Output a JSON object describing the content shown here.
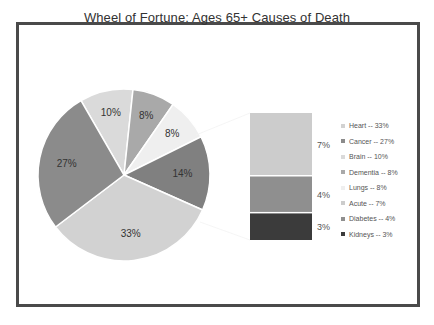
{
  "chart_data": {
    "type": "bar-of-pie",
    "title": "Wheel of Fortune: Ages 65+ Causes of Death",
    "pie": {
      "start_angle_deg": 330,
      "slices": [
        {
          "name": "Brain",
          "value": 10,
          "label": "10%",
          "color": "#dadada"
        },
        {
          "name": "Dementia",
          "value": 8,
          "label": "8%",
          "color": "#a9a9a9"
        },
        {
          "name": "Lungs",
          "value": 8,
          "label": "8%",
          "color": "#efefef"
        },
        {
          "name": "Other",
          "value": 14,
          "label": "14%",
          "color": "#808080"
        },
        {
          "name": "Heart",
          "value": 33,
          "label": "33%",
          "color": "#d2d2d2"
        },
        {
          "name": "Cancer",
          "value": 27,
          "label": "27%",
          "color": "#8b8b8b"
        }
      ]
    },
    "bar": {
      "breakdown_of": "Other",
      "segments": [
        {
          "name": "Acute",
          "value": 7,
          "label": "7%",
          "color": "#cccccc"
        },
        {
          "name": "Diabetes",
          "value": 4,
          "label": "4%",
          "color": "#8f8f8f"
        },
        {
          "name": "Kidneys",
          "value": 3,
          "label": "3%",
          "color": "#3b3b3b"
        }
      ]
    },
    "legend": {
      "position": "right",
      "entries": [
        {
          "label": "Heart -- 33%",
          "color": "#d2d2d2"
        },
        {
          "label": "Cancer -- 27%",
          "color": "#8b8b8b"
        },
        {
          "label": "Brain -- 10%",
          "color": "#dadada"
        },
        {
          "label": "Dementia -- 8%",
          "color": "#a9a9a9"
        },
        {
          "label": "Lungs -- 8%",
          "color": "#efefef"
        },
        {
          "label": "Acute -- 7%",
          "color": "#cccccc"
        },
        {
          "label": "Diabetes -- 4%",
          "color": "#8f8f8f"
        },
        {
          "label": "Kidneys -- 3%",
          "color": "#3b3b3b"
        }
      ]
    }
  },
  "frame_color": "#4a4a4a"
}
